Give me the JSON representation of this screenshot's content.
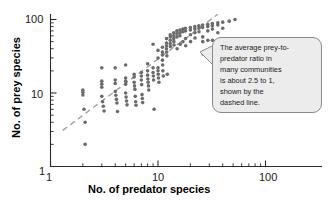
{
  "chart_data": {
    "type": "scatter",
    "title": "",
    "xlabel": "No. of predator species",
    "ylabel": "No. of prey species",
    "xscale": "log",
    "yscale": "log",
    "xlim": [
      1,
      100
    ],
    "ylim": [
      1,
      100
    ],
    "x_tick_labels": [
      "1",
      "10",
      "100"
    ],
    "y_tick_labels": [
      "1",
      "10",
      "100"
    ],
    "x_ticks": [
      1,
      10,
      100
    ],
    "y_ticks": [
      1,
      10,
      100
    ],
    "grid": false,
    "legend": null,
    "point_color": "#6b6b6b",
    "point_radius_px": 1.8,
    "series": [
      {
        "name": "communities",
        "points": [
          [
            2.0,
            11.0
          ],
          [
            2.0,
            10.2
          ],
          [
            2.0,
            9.4
          ],
          [
            2.05,
            6.0
          ],
          [
            2.1,
            4.0
          ],
          [
            2.1,
            2.0
          ],
          [
            3.0,
            22.0
          ],
          [
            3.0,
            14.5
          ],
          [
            3.0,
            13.2
          ],
          [
            3.0,
            12.0
          ],
          [
            3.0,
            9.0
          ],
          [
            3.05,
            7.6
          ],
          [
            3.1,
            6.6
          ],
          [
            3.15,
            5.7
          ],
          [
            4.0,
            22.0
          ],
          [
            4.0,
            15.0
          ],
          [
            4.0,
            13.5
          ],
          [
            4.0,
            10.5
          ],
          [
            4.05,
            9.3
          ],
          [
            4.1,
            8.2
          ],
          [
            4.15,
            7.3
          ],
          [
            4.2,
            5.6
          ],
          [
            5.0,
            24.0
          ],
          [
            5.0,
            16.0
          ],
          [
            5.0,
            14.5
          ],
          [
            5.0,
            13.2
          ],
          [
            5.0,
            10.0
          ],
          [
            5.05,
            8.8
          ],
          [
            5.1,
            7.8
          ],
          [
            5.15,
            6.9
          ],
          [
            6.0,
            18.0
          ],
          [
            6.0,
            16.5
          ],
          [
            6.0,
            14.0
          ],
          [
            6.05,
            12.5
          ],
          [
            6.1,
            11.2
          ],
          [
            6.15,
            9.0
          ],
          [
            6.2,
            7.6
          ],
          [
            6.25,
            6.8
          ],
          [
            7.0,
            19.0
          ],
          [
            7.0,
            17.0
          ],
          [
            7.0,
            15.0
          ],
          [
            7.05,
            13.0
          ],
          [
            7.1,
            9.5
          ],
          [
            7.15,
            8.4
          ],
          [
            7.2,
            7.4
          ],
          [
            8.0,
            25.0
          ],
          [
            8.0,
            20.0
          ],
          [
            8.0,
            17.5
          ],
          [
            8.05,
            15.5
          ],
          [
            8.1,
            14.0
          ],
          [
            8.15,
            12.5
          ],
          [
            8.2,
            11.0
          ],
          [
            9.0,
            46.0
          ],
          [
            9.0,
            22.0
          ],
          [
            9.0,
            19.0
          ],
          [
            9.05,
            17.0
          ],
          [
            9.1,
            15.0
          ],
          [
            9.2,
            6.0
          ],
          [
            10.0,
            38.0
          ],
          [
            10.0,
            30.0
          ],
          [
            10.0,
            22.0
          ],
          [
            10.0,
            20.0
          ],
          [
            10.05,
            18.0
          ],
          [
            10.1,
            16.0
          ],
          [
            10.2,
            14.0
          ],
          [
            11.0,
            42.0
          ],
          [
            11.0,
            36.0
          ],
          [
            11.0,
            33.0
          ],
          [
            11.0,
            28.0
          ],
          [
            11.05,
            24.0
          ],
          [
            11.1,
            20.0
          ],
          [
            11.2,
            17.0
          ],
          [
            12.0,
            55.0
          ],
          [
            12.0,
            48.0
          ],
          [
            12.0,
            44.0
          ],
          [
            12.0,
            40.0
          ],
          [
            12.05,
            36.0
          ],
          [
            12.1,
            32.0
          ],
          [
            12.2,
            18.0
          ],
          [
            13.0,
            62.0
          ],
          [
            13.0,
            58.0
          ],
          [
            13.0,
            52.0
          ],
          [
            13.0,
            47.0
          ],
          [
            13.05,
            43.0
          ],
          [
            14.0,
            66.0
          ],
          [
            14.0,
            60.0
          ],
          [
            14.0,
            55.0
          ],
          [
            14.05,
            50.0
          ],
          [
            14.1,
            45.0
          ],
          [
            15.0,
            70.0
          ],
          [
            15.0,
            64.0
          ],
          [
            15.0,
            58.0
          ],
          [
            15.05,
            40.0
          ],
          [
            16.0,
            72.0
          ],
          [
            16.0,
            66.0
          ],
          [
            16.0,
            60.0
          ],
          [
            16.1,
            46.0
          ],
          [
            17.0,
            74.0
          ],
          [
            17.0,
            68.0
          ],
          [
            17.05,
            50.0
          ],
          [
            18.0,
            76.0
          ],
          [
            18.0,
            70.0
          ],
          [
            18.05,
            55.0
          ],
          [
            18.1,
            44.0
          ],
          [
            20.0,
            78.0
          ],
          [
            20.0,
            72.0
          ],
          [
            20.05,
            62.0
          ],
          [
            20.1,
            50.0
          ],
          [
            22.0,
            80.0
          ],
          [
            22.0,
            74.0
          ],
          [
            22.05,
            66.0
          ],
          [
            22.1,
            56.0
          ],
          [
            24.0,
            82.0
          ],
          [
            24.0,
            76.0
          ],
          [
            24.05,
            68.0
          ],
          [
            26.0,
            84.0
          ],
          [
            26.0,
            78.0
          ],
          [
            26.05,
            58.0
          ],
          [
            26.1,
            50.0
          ],
          [
            26.2,
            34.0
          ],
          [
            29.0,
            86.0
          ],
          [
            29.0,
            80.0
          ],
          [
            29.05,
            70.0
          ],
          [
            29.1,
            52.0
          ],
          [
            32.0,
            88.0
          ],
          [
            32.0,
            82.0
          ],
          [
            32.05,
            74.0
          ],
          [
            32.1,
            52.0
          ],
          [
            36.0,
            90.0
          ],
          [
            36.0,
            84.0
          ],
          [
            36.05,
            66.0
          ],
          [
            40.0,
            92.0
          ],
          [
            40.0,
            76.0
          ],
          [
            46.0,
            95.0
          ],
          [
            52.0,
            100.0
          ]
        ]
      }
    ],
    "trendline": {
      "style": "dashed",
      "color": "#9a9a9a",
      "description": "average prey-to-predator ratio of about 2.5 to 1",
      "ratio": 2.5,
      "x_start": 1.3,
      "y_start": 3.1,
      "x_end": 36.0,
      "y_end": 118.0
    },
    "annotation": {
      "text": "The average prey-to-\npredator ratio in\nmany communities\nis about 2.5 to 1,\nshown by the\ndashed line.",
      "target_point": [
        27.0,
        37.0
      ]
    }
  },
  "axes": {
    "x_label": "No. of predator species",
    "y_label": "No. of prey species",
    "x_tick_1": "1",
    "x_tick_10": "10",
    "x_tick_100": "100",
    "y_tick_1": "1",
    "y_tick_10": "10",
    "y_tick_100": "100"
  },
  "colors": {
    "point": "#6b6b6b",
    "axis": "#2b2b2b",
    "trendline": "#9a9a9a",
    "callout_fill": "#ececec",
    "callout_border": "#8a8a8a",
    "text": "#1a1a1a"
  }
}
